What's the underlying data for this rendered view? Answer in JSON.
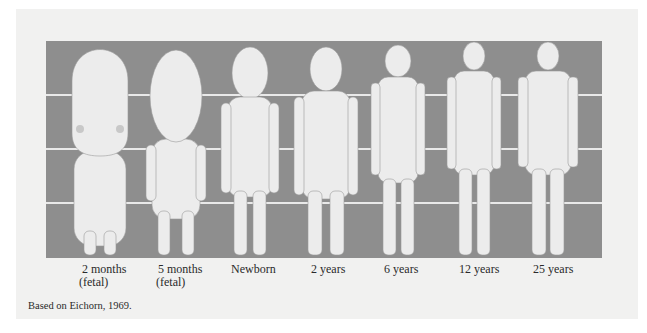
{
  "figure": {
    "colors": {
      "panel": "#8e8e8e",
      "figure": "#ececec",
      "gridline": "#e9e9e9",
      "background": "#f1f1f0"
    },
    "gridlines_count": 3,
    "figures": [
      {
        "id": "2-months",
        "label_line1": "2 months",
        "label_line2": "(fetal)"
      },
      {
        "id": "5-months",
        "label_line1": "5 months",
        "label_line2": "(fetal)"
      },
      {
        "id": "newborn",
        "label_line1": "Newborn",
        "label_line2": ""
      },
      {
        "id": "2-years",
        "label_line1": "2 years",
        "label_line2": ""
      },
      {
        "id": "6-years",
        "label_line1": "6 years",
        "label_line2": ""
      },
      {
        "id": "12-years",
        "label_line1": "12 years",
        "label_line2": ""
      },
      {
        "id": "25-years",
        "label_line1": "25 years",
        "label_line2": ""
      }
    ],
    "caption": "Based on Eichorn, 1969."
  }
}
